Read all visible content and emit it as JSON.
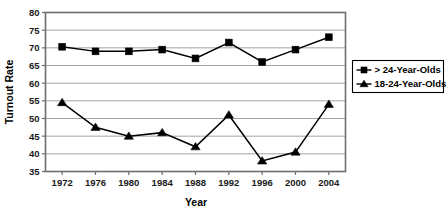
{
  "chart_data": {
    "type": "line",
    "title": "",
    "xlabel": "Year",
    "ylabel": "Turnout Rate",
    "categories": [
      "1972",
      "1976",
      "1980",
      "1984",
      "1988",
      "1992",
      "1996",
      "2000",
      "2004"
    ],
    "x": [
      1972,
      1976,
      1980,
      1984,
      1988,
      1992,
      1996,
      2000,
      2004
    ],
    "xlim": [
      1970,
      2006
    ],
    "ylim": [
      35,
      80
    ],
    "ytick_step": 5,
    "yticks": [
      "35",
      "40",
      "45",
      "50",
      "55",
      "60",
      "65",
      "70",
      "75",
      "80"
    ],
    "grid": "horizontal",
    "legend_position": "right-outside",
    "series": [
      {
        "name": "> 24-Year-Olds",
        "marker": "square",
        "values": [
          70.3,
          69.0,
          69.0,
          69.5,
          67.0,
          71.5,
          66.0,
          69.5,
          73.0
        ]
      },
      {
        "name": "18-24-Year-Olds",
        "marker": "triangle",
        "values": [
          54.5,
          47.5,
          45.0,
          46.0,
          42.0,
          51.0,
          38.0,
          40.5,
          54.0
        ]
      }
    ]
  },
  "legend": {
    "entries": [
      {
        "label": "> 24-Year-Olds",
        "marker": "square"
      },
      {
        "label": "18-24-Year-Olds",
        "marker": "triangle"
      }
    ]
  },
  "axes": {
    "y_title": "Turnout Rate",
    "x_title": "Year"
  },
  "colors": {
    "series": "#000000",
    "grid": "#9a9a9a",
    "axis": "#6e6e6e",
    "background": "#ffffff"
  }
}
